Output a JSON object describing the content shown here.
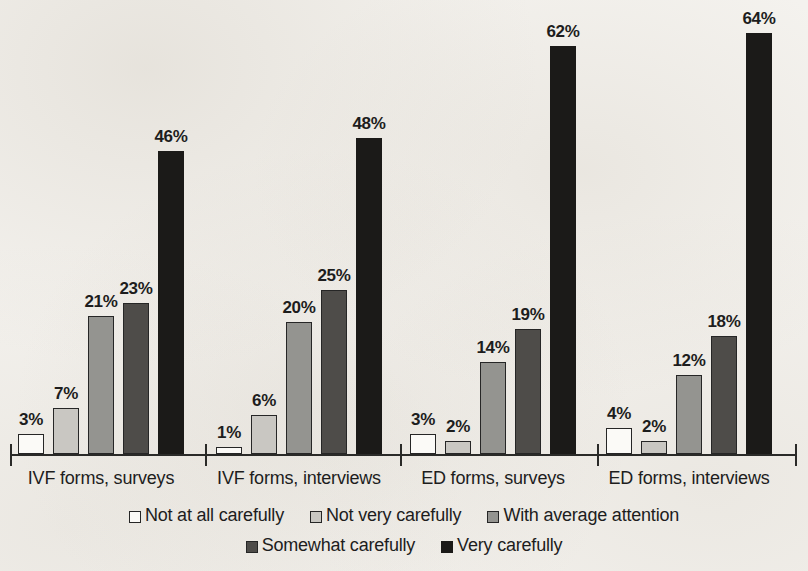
{
  "chart_data": {
    "type": "bar",
    "title": "",
    "subtitle": "",
    "xlabel": "",
    "ylabel": "",
    "ylim": [
      0,
      70
    ],
    "grid": false,
    "legend_position": "bottom",
    "value_suffix": "%",
    "categories": [
      "IVF forms, surveys",
      "IVF forms, interviews",
      "ED forms, surveys",
      "ED forms, interviews"
    ],
    "series": [
      {
        "name": "Not at all carefully",
        "color": "#fbfaf7",
        "values": [
          3,
          1,
          3,
          4
        ],
        "labels": [
          "3%",
          "1%",
          "3%",
          "4%"
        ]
      },
      {
        "name": "Not very carefully",
        "color": "#c9c7c2",
        "values": [
          7,
          6,
          2,
          2
        ],
        "labels": [
          "7%",
          "6%",
          "2%",
          "2%"
        ]
      },
      {
        "name": "With average attention",
        "color": "#949490",
        "values": [
          21,
          20,
          14,
          12
        ],
        "labels": [
          "21%",
          "20%",
          "14%",
          "12%"
        ]
      },
      {
        "name": "Somewhat carefully",
        "color": "#4e4c49",
        "values": [
          23,
          25,
          19,
          18
        ],
        "labels": [
          "23%",
          "25%",
          "19%",
          "18%"
        ]
      },
      {
        "name": "Very carefully",
        "color": "#1b1a18",
        "values": [
          46,
          48,
          62,
          64
        ],
        "labels": [
          "46%",
          "48%",
          "62%",
          "64%"
        ]
      }
    ]
  },
  "legend": {
    "row1": [
      "Not at all carefully",
      "Not very carefully",
      "With average attention"
    ],
    "row2": [
      "Somewhat carefully",
      "Very carefully"
    ]
  },
  "axis": {
    "baseline_label": ""
  }
}
